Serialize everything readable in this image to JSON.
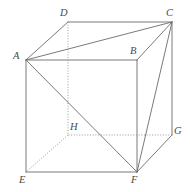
{
  "figure": {
    "name": "cube-abcd-efgh",
    "canvas": {
      "width": 190,
      "height": 192
    },
    "background_color": "#ffffff",
    "solid_line_color": "#6b6b6b",
    "hidden_line_color": "#8d8d8d",
    "label_color": "#4a4a4a"
  },
  "vertices": [
    {
      "id": "A",
      "label": "A",
      "x": 26,
      "y": 60,
      "label_x": 13,
      "label_y": 51,
      "hidden": false
    },
    {
      "id": "B",
      "label": "B",
      "x": 137,
      "y": 60,
      "label_x": 130,
      "label_y": 46,
      "hidden": false
    },
    {
      "id": "C",
      "label": "C",
      "x": 172,
      "y": 22,
      "label_x": 166,
      "label_y": 8,
      "hidden": false
    },
    {
      "id": "D",
      "label": "D",
      "x": 68,
      "y": 22,
      "label_x": 60,
      "label_y": 8,
      "hidden": false
    },
    {
      "id": "E",
      "label": "E",
      "x": 26,
      "y": 172,
      "label_x": 19,
      "label_y": 175,
      "hidden": false
    },
    {
      "id": "F",
      "label": "F",
      "x": 137,
      "y": 172,
      "label_x": 131,
      "label_y": 175,
      "hidden": false
    },
    {
      "id": "G",
      "label": "G",
      "x": 172,
      "y": 135,
      "label_x": 174,
      "label_y": 126,
      "hidden": false
    },
    {
      "id": "H",
      "label": "H",
      "x": 68,
      "y": 135,
      "label_x": 70,
      "label_y": 122,
      "hidden": true
    }
  ],
  "edges": [
    {
      "from": "A",
      "to": "D",
      "style": "solid",
      "kind": "top-face"
    },
    {
      "from": "D",
      "to": "C",
      "style": "solid",
      "kind": "top-face"
    },
    {
      "from": "C",
      "to": "B",
      "style": "solid",
      "kind": "top-face"
    },
    {
      "from": "B",
      "to": "A",
      "style": "solid",
      "kind": "top-face"
    },
    {
      "from": "A",
      "to": "E",
      "style": "solid",
      "kind": "vertical"
    },
    {
      "from": "B",
      "to": "F",
      "style": "solid",
      "kind": "vertical"
    },
    {
      "from": "C",
      "to": "G",
      "style": "solid",
      "kind": "vertical"
    },
    {
      "from": "D",
      "to": "H",
      "style": "dotted",
      "kind": "vertical-hidden"
    },
    {
      "from": "E",
      "to": "F",
      "style": "solid",
      "kind": "bottom-face"
    },
    {
      "from": "F",
      "to": "G",
      "style": "solid",
      "kind": "bottom-face"
    },
    {
      "from": "G",
      "to": "H",
      "style": "dotted",
      "kind": "bottom-face-hidden"
    },
    {
      "from": "H",
      "to": "E",
      "style": "dotted",
      "kind": "bottom-face-hidden"
    }
  ],
  "diagonals": [
    {
      "from": "A",
      "to": "C",
      "style": "solid",
      "kind": "face-diagonal-top"
    },
    {
      "from": "A",
      "to": "F",
      "style": "solid",
      "kind": "face-diagonal-front"
    },
    {
      "from": "C",
      "to": "F",
      "style": "solid",
      "kind": "face-diagonal-right"
    }
  ]
}
